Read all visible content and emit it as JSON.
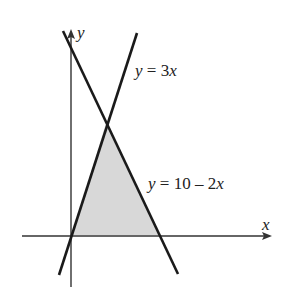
{
  "diagram": {
    "type": "region-between-lines",
    "axes": {
      "x_label": "x",
      "y_label": "y"
    },
    "lines": [
      {
        "id": "line1",
        "label_var": "y",
        "label_eq": " = 3",
        "label_tail": "x",
        "equation": "y = 3x"
      },
      {
        "id": "line2",
        "label_var": "y",
        "label_eq": " = 10 – 2",
        "label_tail": "x",
        "equation": "y = 10 – 2x"
      }
    ],
    "shaded_region": {
      "description": "Triangle bounded by y = 3x, y = 10 - 2x, and the x-axis",
      "vertices": [
        [
          0,
          0
        ],
        [
          2,
          6
        ],
        [
          5,
          0
        ]
      ],
      "fill": "#d9d9d9"
    },
    "colors": {
      "line": "#1a1a1a",
      "axis": "#333333",
      "shade": "#d9d9d9"
    }
  }
}
